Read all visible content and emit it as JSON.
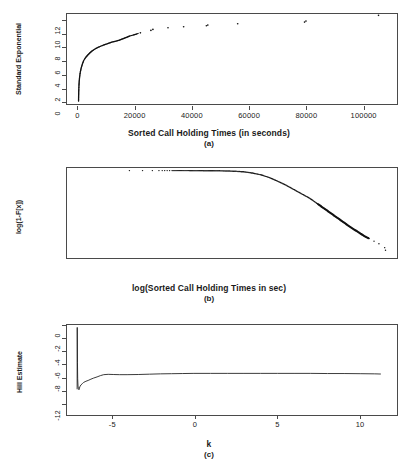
{
  "figure": {
    "background": "#ffffff",
    "ink": "#1a1a1a",
    "frame_color": "#4a4a4a"
  },
  "chart_data": [
    {
      "id": "a",
      "type": "scatter",
      "title": "",
      "caption": "(a)",
      "xlabel": "Sorted Call Holding Times (in seconds)",
      "ylabel": "Standard Exponential",
      "xlim": [
        -4000,
        112000
      ],
      "ylim": [
        -0.4,
        13.0
      ],
      "xticks": [
        0,
        20000,
        40000,
        60000,
        80000,
        100000
      ],
      "xticklabels": [
        "0",
        "20000",
        "40000",
        "60000",
        "80000",
        "100000"
      ],
      "yticks": [
        0,
        2,
        4,
        6,
        8,
        10,
        12
      ],
      "yticklabels": [
        "0",
        "2",
        "4",
        "6",
        "8",
        "10",
        "12"
      ],
      "grid": false,
      "legend": false,
      "description": "QQ-plot of sorted call holding times against standard exponential quantiles; dense concave curve rising steeply near zero then flattening, with sparse isolated points in the upper tail.",
      "points": [
        [
          60,
          0.05
        ],
        [
          80,
          0.6
        ],
        [
          110,
          1.2
        ],
        [
          150,
          1.8
        ],
        [
          200,
          2.3
        ],
        [
          280,
          2.9
        ],
        [
          380,
          3.4
        ],
        [
          520,
          3.9
        ],
        [
          700,
          4.4
        ],
        [
          900,
          4.8
        ],
        [
          1150,
          5.2
        ],
        [
          1450,
          5.6
        ],
        [
          1800,
          6.0
        ],
        [
          2200,
          6.3
        ],
        [
          2700,
          6.6
        ],
        [
          3300,
          6.9
        ],
        [
          4000,
          7.2
        ],
        [
          4800,
          7.5
        ],
        [
          5700,
          7.75
        ],
        [
          6700,
          8.0
        ],
        [
          7800,
          8.2
        ],
        [
          9000,
          8.4
        ],
        [
          10300,
          8.6
        ],
        [
          11700,
          8.8
        ],
        [
          13200,
          8.95
        ],
        [
          14400,
          9.1
        ],
        [
          15300,
          9.25
        ],
        [
          16200,
          9.4
        ],
        [
          17100,
          9.55
        ],
        [
          17900,
          9.7
        ],
        [
          18700,
          9.8
        ],
        [
          19500,
          9.9
        ],
        [
          20300,
          10.0
        ],
        [
          21000,
          10.1
        ],
        [
          21800,
          10.2
        ],
        [
          25500,
          10.55
        ],
        [
          26200,
          10.7
        ],
        [
          31500,
          10.95
        ],
        [
          37000,
          11.1
        ],
        [
          45000,
          11.25
        ],
        [
          45500,
          11.35
        ],
        [
          56000,
          11.55
        ],
        [
          79500,
          11.8
        ],
        [
          80000,
          11.95
        ],
        [
          105500,
          12.8
        ]
      ]
    },
    {
      "id": "b",
      "type": "line",
      "title": "",
      "caption": "(b)",
      "xlabel": "log(Sorted Call Holding Times in sec)",
      "ylabel": "log(1-F[x])",
      "xlim": [
        -7.8,
        12.3
      ],
      "ylim": [
        -13.5,
        0.4
      ],
      "xticks": [
        -5,
        0,
        5,
        10
      ],
      "xticklabels": [
        "-5",
        "0",
        "5",
        "10"
      ],
      "yticks": [
        0,
        -2,
        -4,
        -6,
        -8,
        -10,
        -12
      ],
      "yticklabels": [
        "0",
        "-2",
        "-4",
        "-6",
        "-8",
        "",
        "-12"
      ],
      "grid": false,
      "legend": false,
      "description": "Log-log survival plot: flat near zero for small log-times, then bending downward and decaying approximately linearly with slope near -2.3 in the tail, becoming sparse isolated dots at the far right.",
      "points": [
        [
          -4.0,
          -0.0002
        ],
        [
          -3.2,
          -0.0004
        ],
        [
          -2.6,
          -0.0006
        ],
        [
          -2.2,
          -0.0008
        ],
        [
          -2.0,
          -0.001
        ],
        [
          -1.85,
          -0.0012
        ],
        [
          -1.7,
          -0.0014
        ],
        [
          -1.55,
          -0.0016
        ],
        [
          -1.4,
          -0.002
        ],
        [
          -1.0,
          -0.003
        ],
        [
          -0.5,
          -0.005
        ],
        [
          0.0,
          -0.008
        ],
        [
          0.5,
          -0.012
        ],
        [
          1.0,
          -0.02
        ],
        [
          1.5,
          -0.035
        ],
        [
          2.0,
          -0.06
        ],
        [
          2.5,
          -0.11
        ],
        [
          3.0,
          -0.2
        ],
        [
          3.5,
          -0.38
        ],
        [
          4.0,
          -0.65
        ],
        [
          4.5,
          -1.05
        ],
        [
          5.0,
          -1.6
        ],
        [
          5.5,
          -2.2
        ],
        [
          6.0,
          -2.9
        ],
        [
          6.5,
          -3.6
        ],
        [
          7.0,
          -4.3
        ],
        [
          7.5,
          -5.2
        ],
        [
          8.0,
          -6.1
        ],
        [
          8.5,
          -7.0
        ],
        [
          9.0,
          -7.9
        ],
        [
          9.5,
          -8.8
        ],
        [
          10.0,
          -9.6
        ],
        [
          10.3,
          -10.1
        ],
        [
          10.6,
          -10.5
        ],
        [
          10.9,
          -10.9
        ],
        [
          11.2,
          -11.3
        ],
        [
          11.55,
          -11.9
        ],
        [
          11.6,
          -12.3
        ],
        [
          11.9,
          -13.0
        ]
      ]
    },
    {
      "id": "c",
      "type": "line",
      "title": "",
      "caption": "(c)",
      "xlabel": "k",
      "ylabel": "Hill Estimate",
      "xlim": [
        -180,
        5750
      ],
      "ylim": [
        -0.25,
        5.35
      ],
      "xticks": [
        0,
        1000,
        2000,
        3000,
        4000,
        5000
      ],
      "xticklabels": [
        "0",
        "1000",
        "2000",
        "3000",
        "4000",
        "5000"
      ],
      "yticks": [
        0,
        1,
        2,
        3,
        4,
        5
      ],
      "yticklabels": [
        "0",
        "1",
        "2",
        "3",
        "4",
        "5"
      ],
      "grid": false,
      "legend": false,
      "description": "Hill plot of the tail index estimate versus the number of upper order statistics k; a tall narrow spike to about 5.2 at very small k, a dip to roughly 1.3, then a rapid rise and a long stable plateau near 2.3.",
      "points": [
        [
          2,
          1.35
        ],
        [
          4,
          5.2
        ],
        [
          8,
          3.0
        ],
        [
          12,
          2.0
        ],
        [
          18,
          1.55
        ],
        [
          25,
          1.4
        ],
        [
          35,
          1.32
        ],
        [
          50,
          1.5
        ],
        [
          70,
          1.62
        ],
        [
          95,
          1.7
        ],
        [
          120,
          1.78
        ],
        [
          160,
          1.85
        ],
        [
          200,
          1.9
        ],
        [
          250,
          1.98
        ],
        [
          300,
          2.05
        ],
        [
          360,
          2.12
        ],
        [
          420,
          2.2
        ],
        [
          480,
          2.26
        ],
        [
          560,
          2.28
        ],
        [
          650,
          2.27
        ],
        [
          760,
          2.26
        ],
        [
          900,
          2.26
        ],
        [
          1100,
          2.27
        ],
        [
          1300,
          2.29
        ],
        [
          1500,
          2.31
        ],
        [
          1700,
          2.32
        ],
        [
          1900,
          2.33
        ],
        [
          2100,
          2.34
        ],
        [
          2400,
          2.34
        ],
        [
          2700,
          2.34
        ],
        [
          3000,
          2.34
        ],
        [
          3300,
          2.34
        ],
        [
          3600,
          2.34
        ],
        [
          3900,
          2.34
        ],
        [
          4200,
          2.34
        ],
        [
          4500,
          2.33
        ],
        [
          4800,
          2.33
        ],
        [
          5100,
          2.32
        ],
        [
          5350,
          2.31
        ],
        [
          5460,
          2.3
        ]
      ]
    }
  ]
}
